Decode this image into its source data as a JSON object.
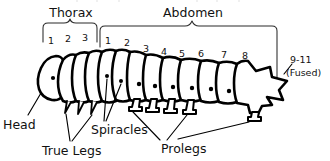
{
  "diagram": {
    "background_color": "#ffffff",
    "ink_color": "#000000",
    "groups": {
      "thorax_label": "Thorax",
      "abdomen_label": "Abdomen"
    },
    "thorax_segments": [
      "1",
      "2",
      "3"
    ],
    "abdomen_segments": [
      "1",
      "2",
      "3",
      "4",
      "5",
      "6",
      "7",
      "8"
    ],
    "terminal_segment": {
      "line1": "9-11",
      "line2": "(Fused)"
    },
    "part_labels": {
      "head": "Head",
      "true_legs": "True Legs",
      "spiracles": "Spiracles",
      "prolegs": "Prolegs"
    }
  }
}
